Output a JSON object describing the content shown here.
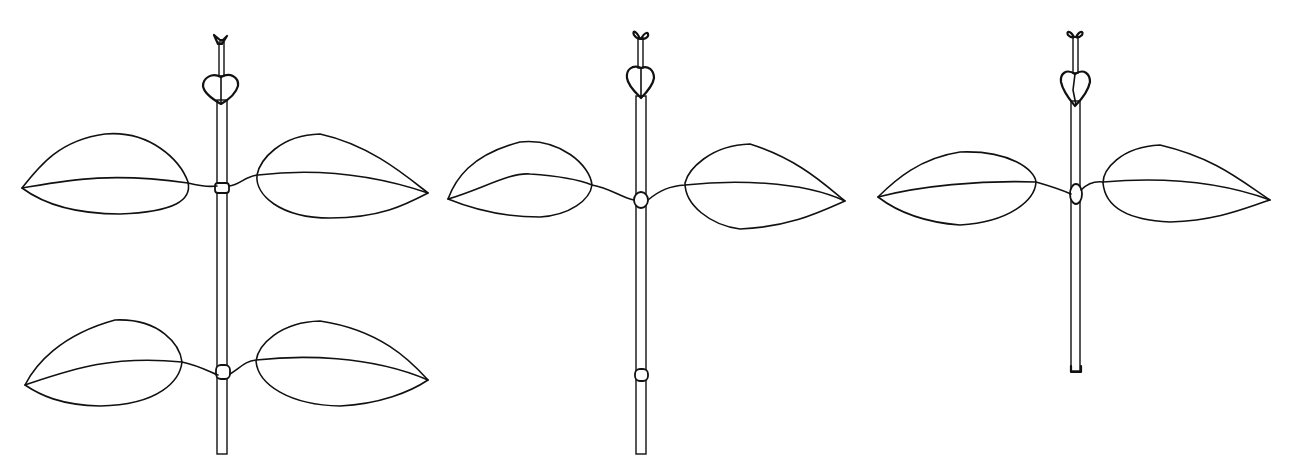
{
  "figure": {
    "ink_color": "#111111",
    "background": "#ffffff",
    "plants": [
      {
        "label": "plant-1",
        "leaf_pairs": 2,
        "nodes": 2
      },
      {
        "label": "plant-2",
        "leaf_pairs": 1,
        "nodes": 2
      },
      {
        "label": "plant-3",
        "leaf_pairs": 1,
        "nodes": 1
      }
    ]
  }
}
